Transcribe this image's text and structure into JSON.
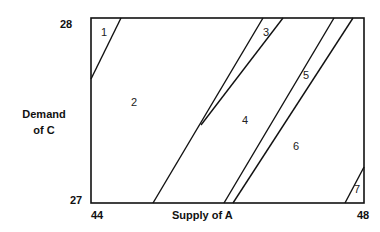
{
  "axes": {
    "y_top": "28",
    "y_bottom": "27",
    "x_left": "44",
    "x_right": "48",
    "y_label_line1": "Demand",
    "y_label_line2": "of C",
    "x_label": "Supply of A"
  },
  "regions": [
    {
      "id": "1",
      "x": 104,
      "y": 33
    },
    {
      "id": "2",
      "x": 134,
      "y": 103
    },
    {
      "id": "3",
      "x": 266,
      "y": 33
    },
    {
      "id": "4",
      "x": 245,
      "y": 121
    },
    {
      "id": "5",
      "x": 306,
      "y": 76
    },
    {
      "id": "6",
      "x": 296,
      "y": 147
    },
    {
      "id": "7",
      "x": 357,
      "y": 190
    }
  ],
  "colors": {
    "line": "#111111",
    "text": "#222222"
  }
}
